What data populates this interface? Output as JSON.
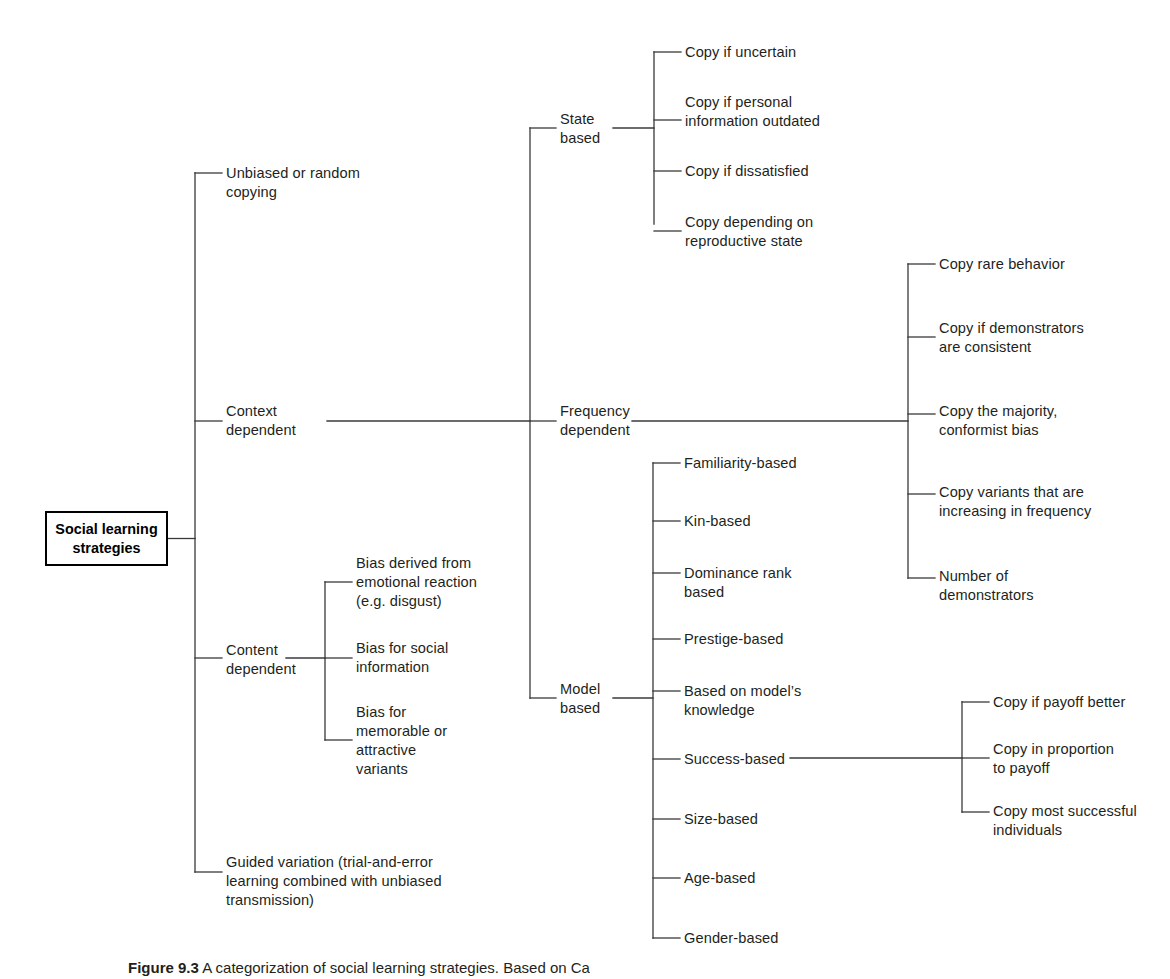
{
  "figure": {
    "root": {
      "label": "Social learning\nstrategies"
    },
    "level1": [
      {
        "id": "unbiased-or-random-copying",
        "label": "Unbiased or random\ncopying"
      },
      {
        "id": "context-dependent",
        "label": "Context\ndependent"
      },
      {
        "id": "content-dependent",
        "label": "Content\ndependent"
      },
      {
        "id": "guided-variation",
        "label": "Guided variation (trial-and-error\nlearning combined with unbiased\ntransmission)"
      }
    ],
    "level2_context": [
      {
        "id": "state-based",
        "label": "State\nbased"
      },
      {
        "id": "frequency-dependent",
        "label": "Frequency\ndependent"
      },
      {
        "id": "model-based",
        "label": "Model\nbased"
      }
    ],
    "state_based_children": [
      {
        "id": "copy-if-uncertain",
        "label": "Copy if uncertain"
      },
      {
        "id": "copy-if-personal-information-outdated",
        "label": "Copy if personal\ninformation outdated"
      },
      {
        "id": "copy-if-dissatisfied",
        "label": "Copy if dissatisfied"
      },
      {
        "id": "copy-depending-on-reproductive-state",
        "label": "Copy depending on\nreproductive state"
      }
    ],
    "frequency_dependent_children": [
      {
        "id": "copy-rare-behavior",
        "label": "Copy rare behavior"
      },
      {
        "id": "copy-if-demonstrators-are-consistent",
        "label": "Copy if demonstrators\nare consistent"
      },
      {
        "id": "copy-the-majority-conformist-bias",
        "label": "Copy the majority,\nconformist bias"
      },
      {
        "id": "copy-variants-increasing-in-frequency",
        "label": "Copy variants that are\nincreasing in frequency"
      },
      {
        "id": "number-of-demonstrators",
        "label": "Number of\ndemonstrators"
      }
    ],
    "model_based_children": [
      {
        "id": "familiarity-based",
        "label": "Familiarity-based"
      },
      {
        "id": "kin-based",
        "label": "Kin-based"
      },
      {
        "id": "dominance-rank-based",
        "label": "Dominance rank\nbased"
      },
      {
        "id": "prestige-based",
        "label": "Prestige-based"
      },
      {
        "id": "based-on-models-knowledge",
        "label": "Based on model’s\nknowledge"
      },
      {
        "id": "success-based",
        "label": "Success-based"
      },
      {
        "id": "size-based",
        "label": "Size-based"
      },
      {
        "id": "age-based",
        "label": "Age-based"
      },
      {
        "id": "gender-based",
        "label": "Gender-based"
      }
    ],
    "success_based_children": [
      {
        "id": "copy-if-payoff-better",
        "label": "Copy if payoff better"
      },
      {
        "id": "copy-in-proportion-to-payoff",
        "label": "Copy in proportion\nto payoff"
      },
      {
        "id": "copy-most-successful-individuals",
        "label": "Copy most successful\nindividuals"
      }
    ],
    "content_dependent_children": [
      {
        "id": "bias-derived-from-emotional-reaction",
        "label": "Bias derived from\nemotional reaction\n(e.g. disgust)"
      },
      {
        "id": "bias-for-social-information",
        "label": "Bias for social\ninformation"
      },
      {
        "id": "bias-for-memorable-or-attractive-variants",
        "label": "Bias for\nmemorable or\nattractive\nvariants"
      }
    ],
    "caption": {
      "number": "Figure 9.3",
      "text": "A categorization of social learning strategies. Based on Ca"
    },
    "colors": {
      "line": "#3a3a3c",
      "text": "#231f20",
      "box_border": "#000000",
      "background": "#ffffff"
    }
  }
}
